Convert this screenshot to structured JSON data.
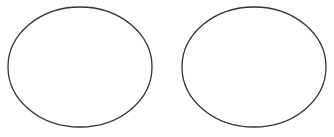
{
  "canvas": {
    "width": 334,
    "height": 137,
    "background": "#ffffff"
  },
  "shapes": [
    {
      "type": "ellipse",
      "cx": 80,
      "cy": 67,
      "rx": 72,
      "ry": 60,
      "stroke": "#333333",
      "stroke_width": 1.3,
      "fill": "none"
    },
    {
      "type": "ellipse",
      "cx": 254,
      "cy": 67,
      "rx": 72,
      "ry": 60,
      "stroke": "#333333",
      "stroke_width": 1.3,
      "fill": "none"
    }
  ]
}
